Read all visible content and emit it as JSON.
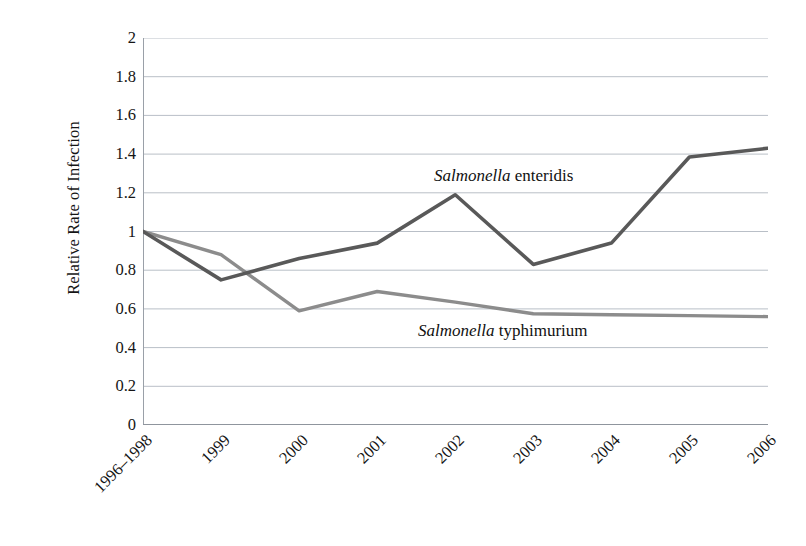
{
  "chart_data": {
    "type": "line",
    "title": "",
    "xlabel": "",
    "ylabel": "Relative Rate of Infection",
    "categories": [
      "1996–1998",
      "1999",
      "2000",
      "2001",
      "2002",
      "2003",
      "2004",
      "2005",
      "2006"
    ],
    "ylim": [
      0,
      2
    ],
    "ytick_labels": [
      "0",
      "0.2",
      "0.4",
      "0.6",
      "0.8",
      "1",
      "1.2",
      "1.4",
      "1.6",
      "1.8",
      "2"
    ],
    "ytick_values": [
      0,
      0.2,
      0.4,
      0.6,
      0.8,
      1,
      1.2,
      1.4,
      1.6,
      1.8,
      2
    ],
    "grid": "horizontal",
    "legend": "inline-annotations",
    "series": [
      {
        "name": "Salmonella enteridis",
        "genus": "Salmonella",
        "species": "enteridis",
        "color": "#595959",
        "values": [
          1.0,
          0.75,
          0.86,
          0.94,
          1.19,
          0.83,
          0.94,
          1.385,
          1.43
        ]
      },
      {
        "name": "Salmonella typhimurium",
        "genus": "Salmonella",
        "species": "typhimurium",
        "color": "#8c8c8c",
        "values": [
          1.0,
          0.88,
          0.59,
          0.69,
          0.635,
          0.575,
          0.57,
          0.565,
          0.56
        ]
      }
    ]
  },
  "axes": {
    "y_title": "Relative Rate of Infection",
    "y_labels": [
      "2",
      "1.8",
      "1.6",
      "1.4",
      "1.2",
      "1",
      "0.8",
      "0.6",
      "0.4",
      "0.2",
      "0"
    ],
    "x_labels": [
      "1996–1998",
      "1999",
      "2000",
      "2001",
      "2002",
      "2003",
      "2004",
      "2005",
      "2006"
    ]
  },
  "annotations": {
    "enteridis": {
      "genus": "Salmonella",
      "species": " enteridis"
    },
    "typhimurium": {
      "genus": "Salmonella",
      "species": " typhimurium"
    }
  },
  "colors": {
    "series_dark": "#595959",
    "series_light": "#8c8c8c",
    "grid": "#b9bfc7",
    "axis": "#9aa0a8",
    "text": "#151515",
    "background": "#ffffff"
  }
}
